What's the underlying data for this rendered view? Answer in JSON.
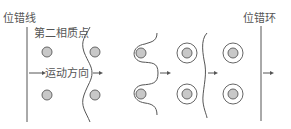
{
  "diagram": {
    "labels": {
      "dislocation_line": "位错线",
      "second_phase_particle": "第二相质点",
      "motion_direction": "运动方向",
      "dislocation_loop": "位错环"
    },
    "stages": [
      {
        "name": "approach",
        "description": "straight dislocation line approaching particles"
      },
      {
        "name": "bowing",
        "description": "dislocation bows between particles"
      },
      {
        "name": "wrapping",
        "description": "dislocation wraps around particles"
      },
      {
        "name": "loops-left",
        "description": "loops left around particles, line moves on"
      },
      {
        "name": "passed",
        "description": "straight dislocation line beyond particles"
      }
    ],
    "colors": {
      "line": "#555555",
      "particle_fill": "#c8c8c8"
    }
  }
}
